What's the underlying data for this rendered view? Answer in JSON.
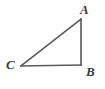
{
  "figure": {
    "name": "right-triangle-ABC",
    "background_color": "#ffffff",
    "stroke_color": "#5a5a5a",
    "label_color": "#3a3a3a",
    "stroke_width": 1.6,
    "vertices": [
      {
        "label": "A",
        "x": 81,
        "y": 19,
        "label_x": 80,
        "label_y": 3
      },
      {
        "label": "B",
        "x": 81,
        "y": 65,
        "label_x": 86,
        "label_y": 65
      },
      {
        "label": "C",
        "x": 21,
        "y": 66,
        "label_x": 6,
        "label_y": 58
      }
    ],
    "edges": [
      {
        "name": "side-AB",
        "from": "A",
        "to": "B"
      },
      {
        "name": "side-BC",
        "from": "B",
        "to": "C"
      },
      {
        "name": "side-CA",
        "from": "C",
        "to": "A"
      }
    ],
    "labels": {
      "A": "A",
      "B": "B",
      "C": "C"
    }
  }
}
